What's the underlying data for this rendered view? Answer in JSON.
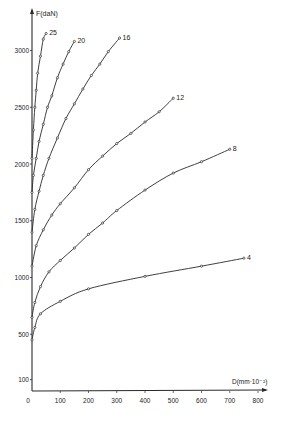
{
  "chart_data": {
    "type": "line",
    "title": "",
    "xlabel": "D(mm·10⁻²)",
    "ylabel": "F(daN)",
    "xlim": [
      0,
      800
    ],
    "ylim": [
      0,
      3200
    ],
    "grid": false,
    "legend": "inline labels at curve ends",
    "x_ticks": [
      0,
      100,
      200,
      300,
      400,
      500,
      600,
      700,
      800
    ],
    "x_tick_labels": [
      "0",
      "100",
      "200",
      "300",
      "400",
      "500",
      "600",
      "700",
      "800"
    ],
    "y_ticks": [
      100,
      500,
      1000,
      1500,
      2000,
      2500,
      3000
    ],
    "y_tick_labels": [
      "100",
      "500",
      "1000",
      "1500",
      "2000",
      "2500",
      "3000"
    ],
    "series": [
      {
        "name": "4",
        "x": [
          0,
          10,
          30,
          100,
          200,
          400,
          600,
          750
        ],
        "y": [
          450,
          560,
          680,
          790,
          900,
          1010,
          1100,
          1170
        ]
      },
      {
        "name": "8",
        "x": [
          0,
          10,
          30,
          60,
          100,
          150,
          200,
          250,
          300,
          400,
          500,
          600,
          700
        ],
        "y": [
          650,
          780,
          920,
          1050,
          1150,
          1260,
          1380,
          1480,
          1590,
          1770,
          1920,
          2020,
          2130
        ]
      },
      {
        "name": "12",
        "x": [
          0,
          15,
          40,
          70,
          100,
          150,
          200,
          250,
          300,
          350,
          400,
          450,
          500
        ],
        "y": [
          1100,
          1280,
          1420,
          1550,
          1650,
          1790,
          1950,
          2070,
          2180,
          2270,
          2370,
          2460,
          2580
        ]
      },
      {
        "name": "16",
        "x": [
          0,
          10,
          25,
          40,
          60,
          90,
          120,
          150,
          180,
          210,
          240,
          270,
          310
        ],
        "y": [
          1400,
          1600,
          1760,
          1900,
          2050,
          2230,
          2400,
          2530,
          2660,
          2780,
          2880,
          2990,
          3110
        ]
      },
      {
        "name": "20",
        "x": [
          0,
          5,
          15,
          25,
          40,
          55,
          70,
          90,
          110,
          130,
          150
        ],
        "y": [
          1750,
          1900,
          2050,
          2200,
          2350,
          2500,
          2600,
          2760,
          2880,
          2990,
          3080
        ]
      },
      {
        "name": "25",
        "x": [
          0,
          5,
          10,
          15,
          20,
          30,
          40,
          50
        ],
        "y": [
          2050,
          2300,
          2500,
          2650,
          2800,
          2950,
          3100,
          3150
        ]
      }
    ]
  },
  "axes": {
    "y_label": "F(daN)",
    "x_label": "D(mm·10⁻²)",
    "origin_label": "0"
  },
  "colors": {
    "line": "#2a2a2a",
    "background": "#ffffff"
  }
}
